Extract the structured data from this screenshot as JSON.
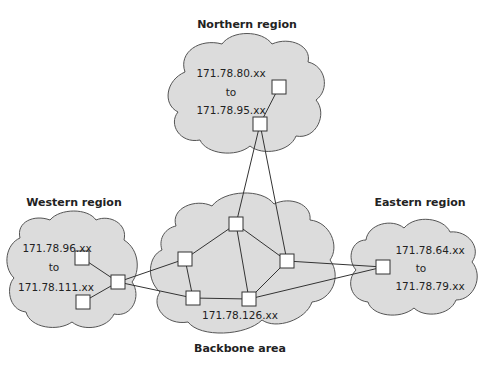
{
  "regions": {
    "northern": {
      "title": "Northern region",
      "range_from": "171.78.80.xx",
      "range_word": "to",
      "range_to": "171.78.95.xx"
    },
    "western": {
      "title": "Western region",
      "range_from": "171.78.96.xx",
      "range_word": "to",
      "range_to": "171.78.111.xx"
    },
    "eastern": {
      "title": "Eastern region",
      "range_from": "171.78.64.xx",
      "range_word": "to",
      "range_to": "171.78.79.xx"
    },
    "backbone": {
      "title": "Backbone area",
      "address": "171.78.126.xx"
    }
  },
  "colors": {
    "cloud_fill": "#dcdcdc",
    "cloud_stroke": "#555555",
    "node_fill": "#ffffff",
    "line": "#333333"
  }
}
